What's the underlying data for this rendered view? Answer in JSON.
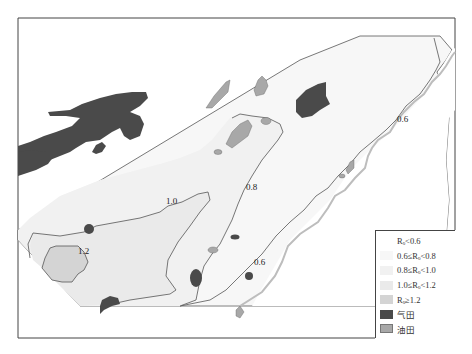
{
  "map": {
    "type": "contour-zonation-map",
    "frame": {
      "x": 18,
      "y": 18,
      "width": 437,
      "height": 320
    },
    "contours": [
      {
        "value": "0.6",
        "label": "0.6",
        "label_pos": [
          403,
          120
        ]
      },
      {
        "value": "0.6",
        "label": "0.6",
        "label_pos": [
          260,
          263
        ]
      },
      {
        "value": "0.8",
        "label": "0.8",
        "label_pos": [
          252,
          188
        ]
      },
      {
        "value": "1.0",
        "label": "1.0",
        "label_pos": [
          172,
          202
        ]
      },
      {
        "value": "1.2",
        "label": "1.2",
        "label_pos": [
          86,
          252
        ]
      }
    ],
    "colors": {
      "zone_lt_0_6": "#ffffff",
      "zone_0_6_0_8": "#f7f7f7",
      "zone_0_8_1_0": "#f1f1f1",
      "zone_1_0_1_2": "#eaeaea",
      "zone_ge_1_2": "#d4d4d4",
      "gas_field": "#4a4a4a",
      "oil_field": "#a8a8a8",
      "boundary": "#555555",
      "outer_boundary": "#bdbdbd"
    }
  },
  "legend": {
    "items": [
      {
        "label": "Rₒ<0.6",
        "swatch": "#ffffff"
      },
      {
        "label": "0.6≤Rₒ<0.8",
        "swatch": "#f7f7f7"
      },
      {
        "label": "0.8≤Rₒ<1.0",
        "swatch": "#f1f1f1"
      },
      {
        "label": "1.0≤Rₒ<1.2",
        "swatch": "#eaeaea"
      },
      {
        "label": "Rₒ≥1.2",
        "swatch": "#d4d4d4"
      },
      {
        "label": "气田",
        "swatch": "#4a4a4a"
      },
      {
        "label": "油田",
        "swatch": "#a8a8a8"
      }
    ]
  }
}
